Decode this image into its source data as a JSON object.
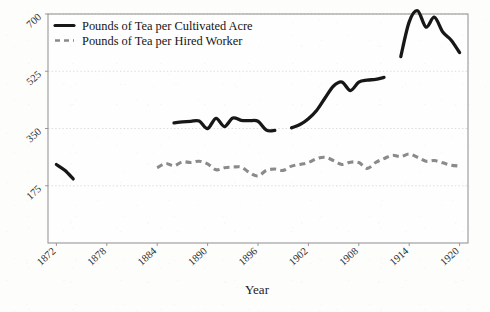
{
  "figure": {
    "background_color": "#fdfdfc",
    "frame_color": "#8d8d8d",
    "gridline_color": "#d8d8d8"
  },
  "axes": {
    "x_title": "Year",
    "y_title": "",
    "x_ticks": [
      "1872",
      "1878",
      "1884",
      "1890",
      "1896",
      "1902",
      "1908",
      "1914",
      "1920"
    ],
    "y_ticks": [
      "175",
      "350",
      "525",
      "700"
    ]
  },
  "legend": {
    "entries": [
      {
        "label": "Pounds of Tea per Cultivated Acre",
        "style": "solid",
        "color": "#171717"
      },
      {
        "label": "Pounds of Tea per Hired Worker",
        "style": "dashed",
        "color": "#8a8a8a"
      }
    ]
  },
  "chart_data": {
    "type": "line",
    "title": "",
    "subtitle": "",
    "xlabel": "Year",
    "ylabel": "",
    "xlim": [
      1871,
      1921
    ],
    "ylim": [
      0,
      700
    ],
    "xticks": [
      1872,
      1878,
      1884,
      1890,
      1896,
      1902,
      1908,
      1914,
      1920
    ],
    "yticks": [
      175,
      350,
      525,
      700
    ],
    "grid": true,
    "legend_position": "top-left",
    "series": [
      {
        "name": "Pounds of Tea per Cultivated Acre",
        "style": "solid",
        "color": "#171717",
        "segments": [
          {
            "x": [
              1872,
              1873,
              1874
            ],
            "y": [
              240,
              222,
              196
            ]
          },
          {
            "x": [
              1886,
              1887,
              1888,
              1889,
              1890,
              1891,
              1892,
              1893,
              1894,
              1895,
              1896,
              1897,
              1898
            ],
            "y": [
              367,
              370,
              372,
              373,
              350,
              381,
              356,
              382,
              375,
              374,
              372,
              345,
              344
            ]
          },
          {
            "x": [
              1900,
              1901,
              1902,
              1903,
              1904,
              1905,
              1906,
              1907,
              1908,
              1909,
              1910,
              1911
            ],
            "y": [
              352,
              362,
              380,
              406,
              444,
              480,
              492,
              466,
              492,
              498,
              500,
              506
            ]
          },
          {
            "x": [
              1913,
              1914,
              1915,
              1916,
              1917,
              1918,
              1919,
              1920
            ],
            "y": [
              570,
              676,
              710,
              660,
              690,
              645,
              620,
              582
            ]
          }
        ]
      },
      {
        "name": "Pounds of Tea per Hired Worker",
        "style": "dashed",
        "color": "#8a8a8a",
        "segments": [
          {
            "x": [
              1884,
              1885,
              1886,
              1887,
              1888,
              1889,
              1890,
              1891,
              1892,
              1893,
              1894,
              1895,
              1896,
              1897,
              1898,
              1899,
              1900,
              1901,
              1902,
              1903,
              1904,
              1905,
              1906,
              1907,
              1908,
              1909,
              1910,
              1911,
              1912,
              1913,
              1914,
              1915,
              1916,
              1917,
              1918,
              1919,
              1920
            ],
            "y": [
              230,
              243,
              236,
              248,
              246,
              250,
              242,
              224,
              230,
              232,
              232,
              215,
              205,
              222,
              226,
              222,
              235,
              240,
              246,
              258,
              262,
              252,
              240,
              247,
              246,
              228,
              246,
              258,
              268,
              264,
              272,
              262,
              250,
              252,
              245,
              238,
              235
            ]
          }
        ]
      }
    ]
  }
}
